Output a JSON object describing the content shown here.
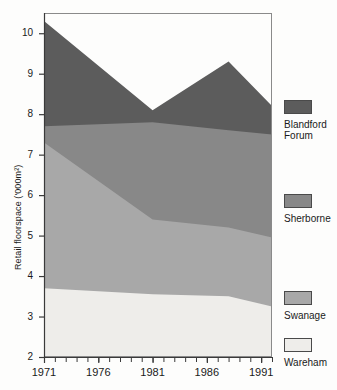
{
  "chart_data": {
    "type": "area",
    "title": "",
    "subtitle": "",
    "xlabel": "",
    "ylabel": "Retail floorspace ('000m²)",
    "stacked": true,
    "grid": false,
    "legend_position": "right",
    "xlim": [
      1971,
      1992
    ],
    "ylim": [
      2,
      10.5
    ],
    "yticks": [
      2,
      3,
      4,
      5,
      6,
      7,
      8,
      9,
      10
    ],
    "ytick_labels": [
      "2",
      "3",
      "4",
      "5",
      "6",
      "7",
      "8",
      "9",
      "10"
    ],
    "xticks": [
      1971,
      1976,
      1981,
      1986,
      1991
    ],
    "xtick_labels": [
      "1971",
      "1976",
      "1981",
      "1986",
      "1991"
    ],
    "x_minor_ticks": [
      1971,
      1972,
      1973,
      1974,
      1975,
      1976,
      1977,
      1978,
      1979,
      1980,
      1981,
      1982,
      1983,
      1984,
      1985,
      1986,
      1987,
      1988,
      1989,
      1990,
      1991,
      1992
    ],
    "x": [
      1971,
      1981,
      1988,
      1992
    ],
    "series": [
      {
        "name": "Wareham",
        "color": "#eeedea",
        "values": [
          3.7,
          3.55,
          3.5,
          3.25
        ],
        "order": 1
      },
      {
        "name": "Swanage",
        "color": "#a8a8a8",
        "values": [
          3.6,
          1.85,
          1.7,
          1.7
        ],
        "order": 2
      },
      {
        "name": "Sherborne",
        "color": "#888888",
        "values": [
          0.4,
          2.4,
          2.4,
          2.55
        ],
        "order": 3
      },
      {
        "name": "Blandford Forum",
        "color": "#5c5c5c",
        "values": [
          2.6,
          0.3,
          1.7,
          0.7
        ],
        "order": 4
      }
    ],
    "cumulative_tops": {
      "Wareham": [
        3.7,
        3.55,
        3.5,
        3.25
      ],
      "Swanage": [
        7.3,
        5.4,
        5.2,
        4.95
      ],
      "Sherborne": [
        7.7,
        7.8,
        7.6,
        7.5
      ],
      "Blandford Forum": [
        10.3,
        8.1,
        9.3,
        8.2
      ]
    }
  },
  "legend": {
    "entries": [
      {
        "label_line1": "Blandford",
        "label_line2": "Forum",
        "color": "#5c5c5c"
      },
      {
        "label_line1": "Sherborne",
        "label_line2": "",
        "color": "#888888"
      },
      {
        "label_line1": "Swanage",
        "label_line2": "",
        "color": "#a8a8a8"
      },
      {
        "label_line1": "Wareham",
        "label_line2": "",
        "color": "#eeedea"
      }
    ]
  },
  "plot": {
    "background": "#fdfdfc",
    "border_color": "#8a8a8a",
    "axis_color": "#3a3a3a"
  }
}
